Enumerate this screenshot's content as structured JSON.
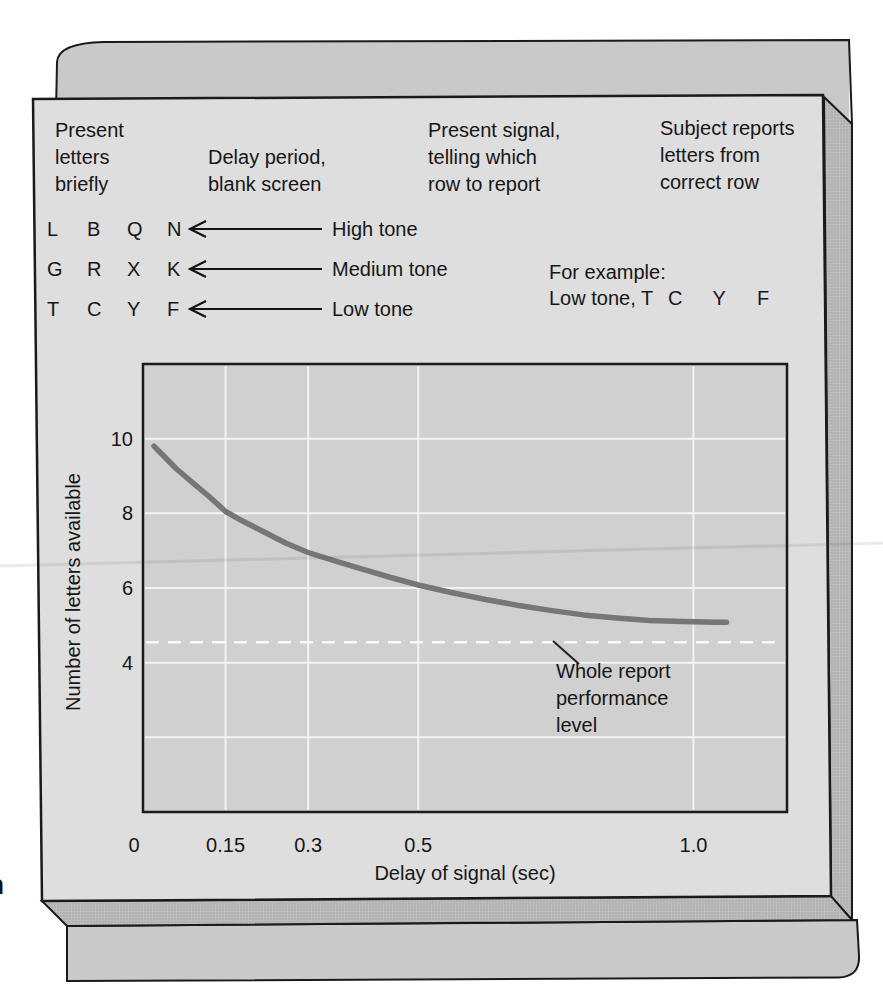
{
  "page": {
    "margin_clipped_chars": [
      "n",
      "l"
    ]
  },
  "procedure": {
    "step1_header": "Present\nletters\nbriefly",
    "step2_header": "Delay period,\nblank screen",
    "step3_header": "Present signal,\ntelling which\nrow to report",
    "step4_header": "Subject reports\nletters from\ncorrect row",
    "letter_rows": [
      {
        "letters": [
          "L",
          "B",
          "Q",
          "N"
        ],
        "tone": "High tone"
      },
      {
        "letters": [
          "G",
          "R",
          "X",
          "K"
        ],
        "tone": "Medium tone"
      },
      {
        "letters": [
          "T",
          "C",
          "Y",
          "F"
        ],
        "tone": "Low tone"
      }
    ],
    "example": {
      "label": "For example:",
      "prefix": "Low tone, T",
      "reported_letters": [
        "C",
        "Y",
        "F"
      ]
    }
  },
  "chart_data": {
    "type": "line",
    "title": "",
    "xlabel": "Delay of signal (sec)",
    "ylabel": "Number of letters available",
    "xlim": [
      0,
      1.17
    ],
    "ylim": [
      0,
      12
    ],
    "grid": true,
    "legend": false,
    "x_ticks": [
      {
        "value": 0,
        "label": "0"
      },
      {
        "value": 0.15,
        "label": "0.15"
      },
      {
        "value": 0.3,
        "label": "0.3"
      },
      {
        "value": 0.5,
        "label": "0.5"
      },
      {
        "value": 1.0,
        "label": "1.0"
      }
    ],
    "y_ticks": [
      {
        "value": 4,
        "label": "4"
      },
      {
        "value": 6,
        "label": "6"
      },
      {
        "value": 8,
        "label": "8"
      },
      {
        "value": 10,
        "label": "10"
      }
    ],
    "x_gridlines": [
      0.15,
      0.3,
      0.5,
      1.0
    ],
    "y_gridlines": [
      2,
      4,
      6,
      8,
      10
    ],
    "series": [
      {
        "name": "Partial report: letters available",
        "points": [
          [
            0.02,
            9.8
          ],
          [
            0.04,
            9.5
          ],
          [
            0.06,
            9.2
          ],
          [
            0.09,
            8.82
          ],
          [
            0.12,
            8.45
          ],
          [
            0.15,
            8.05
          ],
          [
            0.18,
            7.8
          ],
          [
            0.22,
            7.5
          ],
          [
            0.26,
            7.2
          ],
          [
            0.3,
            6.95
          ],
          [
            0.35,
            6.72
          ],
          [
            0.4,
            6.5
          ],
          [
            0.45,
            6.28
          ],
          [
            0.5,
            6.08
          ],
          [
            0.56,
            5.88
          ],
          [
            0.62,
            5.7
          ],
          [
            0.68,
            5.54
          ],
          [
            0.74,
            5.4
          ],
          [
            0.8,
            5.28
          ],
          [
            0.86,
            5.2
          ],
          [
            0.92,
            5.13
          ],
          [
            0.98,
            5.1
          ],
          [
            1.04,
            5.08
          ],
          [
            1.06,
            5.08
          ]
        ]
      }
    ],
    "reference_line": {
      "value": 4.55,
      "style": "dashed",
      "label": "Whole report\nperformance\nlevel"
    }
  },
  "colors": {
    "curve": "#767676",
    "gridline": "#f3f3f3",
    "reference_line": "#f8f8f8",
    "plot_background": "#d0d0d0",
    "panel_background": "#dedede",
    "text": "#161616"
  }
}
